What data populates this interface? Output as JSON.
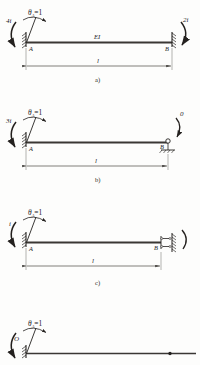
{
  "figure": {
    "ink_color": "#24211f",
    "beam_color": "#3a3734",
    "paper_color": "#fdfdfc"
  },
  "panels": [
    {
      "caption": "a)",
      "rotation_label": "θ",
      "rotation_subscript": "A",
      "rotation_equals": "=1",
      "left_moment": "4i",
      "right_moment": "2i",
      "node_left": "A",
      "node_right": "B",
      "beam_label": "EI",
      "span_label": "l",
      "left_support": "fixed",
      "right_support": "fixed"
    },
    {
      "caption": "b)",
      "rotation_label": "θ",
      "rotation_subscript": "A",
      "rotation_equals": "=1",
      "left_moment": "3i",
      "right_moment": "0",
      "node_left": "A",
      "node_right": "B",
      "beam_label": "",
      "span_label": "l",
      "left_support": "fixed",
      "right_support": "pinned"
    },
    {
      "caption": "c)",
      "rotation_label": "θ",
      "rotation_subscript": "A",
      "rotation_equals": "=1",
      "left_moment": "i",
      "right_moment": "",
      "node_left": "A",
      "node_right": "B",
      "beam_label": "",
      "span_label": "l",
      "left_support": "fixed",
      "right_support": "guided"
    },
    {
      "caption": "",
      "rotation_label": "θ",
      "rotation_subscript": "A",
      "rotation_equals": "=1",
      "left_moment": "O",
      "right_moment": "",
      "node_left": "",
      "node_right": "",
      "beam_label": "",
      "span_label": "",
      "left_support": "fixed",
      "right_support": "none"
    }
  ]
}
